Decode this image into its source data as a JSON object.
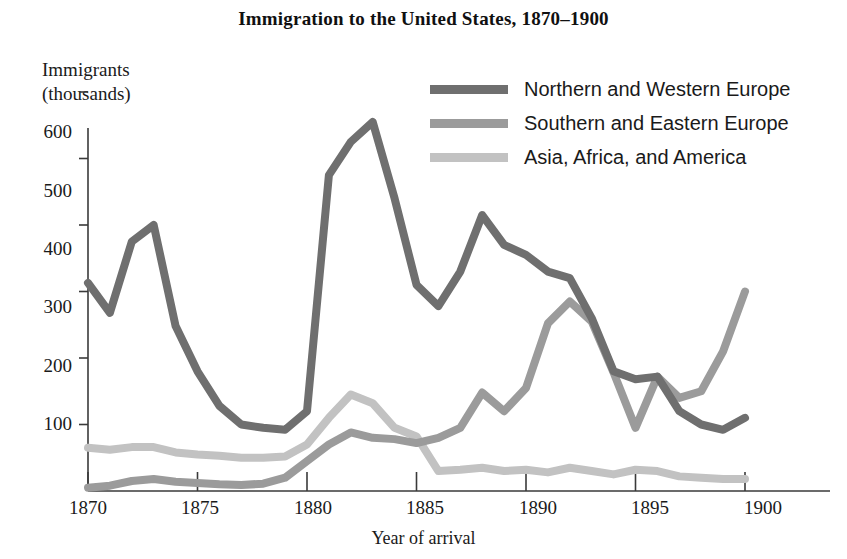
{
  "chart_data": {
    "type": "line",
    "title": "Immigration to the United States, 1870–1900",
    "xlabel": "Year of arrival",
    "ylabel": "Immigrants\n(thousands)",
    "xlim": [
      1870,
      1900
    ],
    "ylim": [
      0,
      640
    ],
    "grid": false,
    "legend_position": "top-right",
    "xticks": [
      1870,
      1875,
      1880,
      1885,
      1890,
      1895,
      1900
    ],
    "xtick_labels": [
      "1870",
      "1875",
      "1880",
      "1885",
      "1890",
      "1895",
      "1900"
    ],
    "yticks": [
      100,
      200,
      300,
      400,
      500,
      600
    ],
    "ytick_labels": [
      "100",
      "200",
      "300",
      "400",
      "500",
      "600"
    ],
    "x": [
      1870,
      1871,
      1872,
      1873,
      1874,
      1875,
      1876,
      1877,
      1878,
      1879,
      1880,
      1881,
      1882,
      1883,
      1884,
      1885,
      1886,
      1887,
      1888,
      1889,
      1890,
      1891,
      1892,
      1893,
      1894,
      1895,
      1896,
      1897,
      1898,
      1899,
      1900
    ],
    "series": [
      {
        "name": "Northern and Western Europe",
        "color": "#6f6f6f",
        "values": [
          313,
          268,
          375,
          400,
          248,
          180,
          128,
          100,
          95,
          92,
          120,
          475,
          525,
          555,
          440,
          310,
          278,
          330,
          415,
          370,
          355,
          330,
          320,
          260,
          180,
          168,
          172,
          120,
          100,
          92,
          110
        ]
      },
      {
        "name": "Southern and Eastern Europe",
        "color": "#9b9b9b",
        "values": [
          5,
          8,
          15,
          18,
          14,
          12,
          10,
          9,
          11,
          20,
          45,
          70,
          88,
          80,
          78,
          72,
          80,
          95,
          148,
          120,
          155,
          252,
          285,
          255,
          178,
          95,
          172,
          140,
          150,
          210,
          300
        ]
      },
      {
        "name": "Asia, Africa, and America",
        "color": "#c2c2c2",
        "values": [
          65,
          62,
          66,
          66,
          58,
          55,
          53,
          50,
          50,
          52,
          70,
          110,
          145,
          132,
          95,
          82,
          30,
          32,
          35,
          30,
          32,
          28,
          35,
          30,
          25,
          32,
          30,
          22,
          20,
          18,
          18
        ]
      }
    ]
  },
  "axes": {
    "y_label_line1": "Immigrants",
    "y_label_line2": "(thousands)"
  }
}
